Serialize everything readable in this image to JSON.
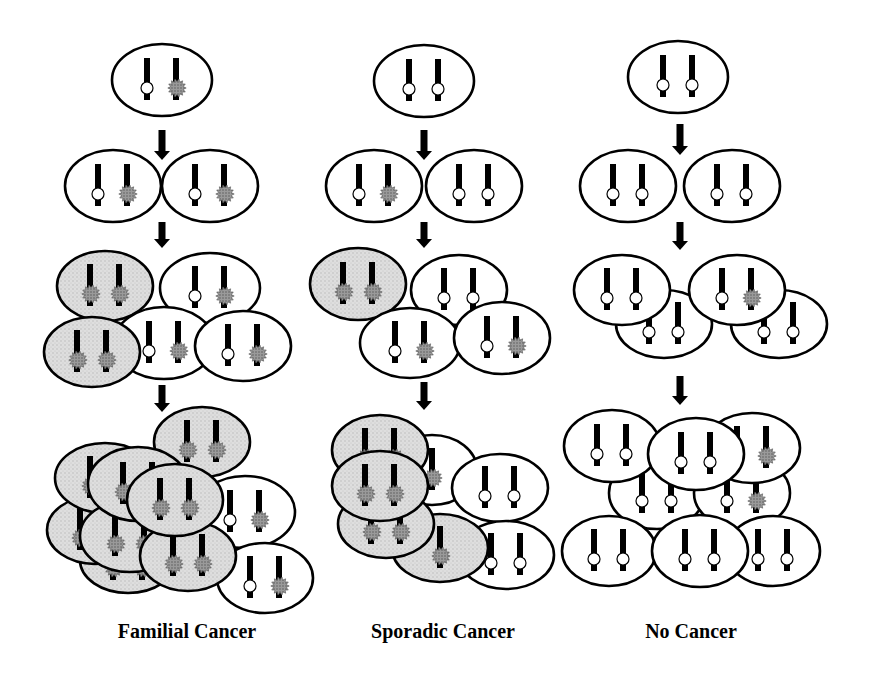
{
  "colors": {
    "outline": "#000000",
    "cell_normal": "#ffffff",
    "cell_tumor": "#d9d9d9",
    "mutant_allele": "#8a8a8a",
    "wildtype_allele": "#ffffff",
    "chromosome": "#000000"
  },
  "legend_semantics": {
    "open-circle": "wild-type allele",
    "spiky-gray-blob": "mutant allele",
    "gray-cell": "tumor cell (both alleles mutated)"
  },
  "columns": [
    {
      "id": "familial",
      "label": "Familial Cancer",
      "label_x": 187,
      "arrows": [
        [
          162,
          130,
          160
        ],
        [
          162,
          222,
          248
        ],
        [
          162,
          385,
          412
        ]
      ],
      "cells": [
        {
          "cx": 162,
          "cy": 80,
          "rx": 50,
          "ry": 36,
          "tumor": false,
          "alleles": [
            "wt",
            "mut"
          ]
        },
        {
          "cx": 113,
          "cy": 186,
          "rx": 48,
          "ry": 36,
          "tumor": false,
          "alleles": [
            "wt",
            "mut"
          ]
        },
        {
          "cx": 210,
          "cy": 186,
          "rx": 48,
          "ry": 36,
          "tumor": false,
          "alleles": [
            "wt",
            "mut"
          ]
        },
        {
          "cx": 210,
          "cy": 288,
          "rx": 50,
          "ry": 35,
          "tumor": false,
          "alleles": [
            "wt",
            "mut"
          ]
        },
        {
          "cx": 105,
          "cy": 286,
          "rx": 48,
          "ry": 35,
          "tumor": true,
          "alleles": [
            "mut",
            "mut"
          ]
        },
        {
          "cx": 164,
          "cy": 343,
          "rx": 50,
          "ry": 36,
          "tumor": false,
          "alleles": [
            "wt",
            "mut"
          ]
        },
        {
          "cx": 243,
          "cy": 346,
          "rx": 48,
          "ry": 35,
          "tumor": false,
          "alleles": [
            "wt",
            "mut"
          ]
        },
        {
          "cx": 92,
          "cy": 352,
          "rx": 48,
          "ry": 35,
          "tumor": true,
          "alleles": [
            "mut",
            "mut"
          ]
        },
        {
          "cx": 128,
          "cy": 560,
          "rx": 48,
          "ry": 33,
          "tumor": true,
          "alleles": [
            "mut",
            "mut"
          ]
        },
        {
          "cx": 245,
          "cy": 512,
          "rx": 50,
          "ry": 36,
          "tumor": false,
          "alleles": [
            "wt",
            "mut"
          ]
        },
        {
          "cx": 265,
          "cy": 578,
          "rx": 48,
          "ry": 35,
          "tumor": false,
          "alleles": [
            "wt",
            "mut"
          ]
        },
        {
          "cx": 95,
          "cy": 530,
          "rx": 48,
          "ry": 34,
          "tumor": true,
          "alleles": [
            "mut",
            "mut"
          ]
        },
        {
          "cx": 105,
          "cy": 478,
          "rx": 50,
          "ry": 35,
          "tumor": true,
          "alleles": [
            "mut",
            "mut"
          ]
        },
        {
          "cx": 202,
          "cy": 442,
          "rx": 48,
          "ry": 35,
          "tumor": true,
          "alleles": [
            "mut",
            "mut"
          ]
        },
        {
          "cx": 130,
          "cy": 536,
          "rx": 50,
          "ry": 36,
          "tumor": true,
          "alleles": [
            "mut",
            "mut"
          ]
        },
        {
          "cx": 138,
          "cy": 484,
          "rx": 50,
          "ry": 37,
          "tumor": true,
          "alleles": [
            "mut",
            "mut"
          ]
        },
        {
          "cx": 188,
          "cy": 556,
          "rx": 48,
          "ry": 35,
          "tumor": true,
          "alleles": [
            "mut",
            "mut"
          ]
        },
        {
          "cx": 175,
          "cy": 500,
          "rx": 48,
          "ry": 36,
          "tumor": true,
          "alleles": [
            "mut",
            "mut"
          ]
        }
      ]
    },
    {
      "id": "sporadic",
      "label": "Sporadic Cancer",
      "label_x": 443,
      "arrows": [
        [
          424,
          130,
          160
        ],
        [
          424,
          222,
          248
        ],
        [
          424,
          382,
          410
        ]
      ],
      "cells": [
        {
          "cx": 424,
          "cy": 81,
          "rx": 50,
          "ry": 36,
          "tumor": false,
          "alleles": [
            "wt",
            "wt"
          ]
        },
        {
          "cx": 374,
          "cy": 186,
          "rx": 48,
          "ry": 36,
          "tumor": false,
          "alleles": [
            "wt",
            "mut"
          ]
        },
        {
          "cx": 474,
          "cy": 186,
          "rx": 48,
          "ry": 36,
          "tumor": false,
          "alleles": [
            "wt",
            "wt"
          ]
        },
        {
          "cx": 459,
          "cy": 290,
          "rx": 48,
          "ry": 35,
          "tumor": false,
          "alleles": [
            "wt",
            "wt"
          ]
        },
        {
          "cx": 358,
          "cy": 284,
          "rx": 48,
          "ry": 36,
          "tumor": true,
          "alleles": [
            "mut",
            "mut"
          ]
        },
        {
          "cx": 410,
          "cy": 343,
          "rx": 50,
          "ry": 35,
          "tumor": false,
          "alleles": [
            "wt",
            "mut"
          ]
        },
        {
          "cx": 502,
          "cy": 338,
          "rx": 48,
          "ry": 36,
          "tumor": false,
          "alleles": [
            "wt",
            "mut"
          ]
        },
        {
          "cx": 432,
          "cy": 470,
          "rx": 45,
          "ry": 35,
          "tumor": false,
          "alleles": [
            "mut"
          ]
        },
        {
          "cx": 500,
          "cy": 488,
          "rx": 48,
          "ry": 34,
          "tumor": false,
          "alleles": [
            "wt",
            "wt"
          ]
        },
        {
          "cx": 506,
          "cy": 555,
          "rx": 48,
          "ry": 34,
          "tumor": false,
          "alleles": [
            "wt",
            "wt"
          ]
        },
        {
          "cx": 440,
          "cy": 548,
          "rx": 48,
          "ry": 34,
          "tumor": true,
          "alleles": [
            "mut"
          ]
        },
        {
          "cx": 386,
          "cy": 524,
          "rx": 48,
          "ry": 34,
          "tumor": true,
          "alleles": [
            "mut",
            "mut"
          ]
        },
        {
          "cx": 380,
          "cy": 450,
          "rx": 48,
          "ry": 35,
          "tumor": true,
          "alleles": [
            "mut",
            "mut"
          ]
        },
        {
          "cx": 380,
          "cy": 486,
          "rx": 48,
          "ry": 35,
          "tumor": true,
          "alleles": [
            "mut",
            "mut"
          ]
        }
      ]
    },
    {
      "id": "none",
      "label": "No Cancer",
      "label_x": 691,
      "arrows": [
        [
          680,
          124,
          155
        ],
        [
          680,
          222,
          250
        ],
        [
          680,
          376,
          405
        ]
      ],
      "cells": [
        {
          "cx": 678,
          "cy": 77,
          "rx": 50,
          "ry": 36,
          "tumor": false,
          "alleles": [
            "wt",
            "wt"
          ]
        },
        {
          "cx": 628,
          "cy": 186,
          "rx": 48,
          "ry": 36,
          "tumor": false,
          "alleles": [
            "wt",
            "wt"
          ]
        },
        {
          "cx": 732,
          "cy": 186,
          "rx": 48,
          "ry": 36,
          "tumor": false,
          "alleles": [
            "wt",
            "wt"
          ]
        },
        {
          "cx": 664,
          "cy": 324,
          "rx": 48,
          "ry": 34,
          "tumor": false,
          "alleles": [
            "wt",
            "wt"
          ]
        },
        {
          "cx": 779,
          "cy": 324,
          "rx": 48,
          "ry": 34,
          "tumor": false,
          "alleles": [
            "wt",
            "wt"
          ]
        },
        {
          "cx": 622,
          "cy": 290,
          "rx": 48,
          "ry": 35,
          "tumor": false,
          "alleles": [
            "wt",
            "wt"
          ]
        },
        {
          "cx": 737,
          "cy": 290,
          "rx": 48,
          "ry": 35,
          "tumor": false,
          "alleles": [
            "wt",
            "mut"
          ]
        },
        {
          "cx": 657,
          "cy": 493,
          "rx": 48,
          "ry": 36,
          "tumor": false,
          "alleles": [
            "wt",
            "wt"
          ]
        },
        {
          "cx": 742,
          "cy": 493,
          "rx": 48,
          "ry": 36,
          "tumor": false,
          "alleles": [
            "wt",
            "mut"
          ]
        },
        {
          "cx": 752,
          "cy": 448,
          "rx": 48,
          "ry": 35,
          "tumor": false,
          "alleles": [
            "wt",
            "mut"
          ]
        },
        {
          "cx": 609,
          "cy": 551,
          "rx": 47,
          "ry": 35,
          "tumor": false,
          "alleles": [
            "wt",
            "wt"
          ]
        },
        {
          "cx": 773,
          "cy": 551,
          "rx": 47,
          "ry": 35,
          "tumor": false,
          "alleles": [
            "wt",
            "wt"
          ]
        },
        {
          "cx": 612,
          "cy": 446,
          "rx": 48,
          "ry": 36,
          "tumor": false,
          "alleles": [
            "wt",
            "wt"
          ]
        },
        {
          "cx": 696,
          "cy": 454,
          "rx": 48,
          "ry": 36,
          "tumor": false,
          "alleles": [
            "wt",
            "wt"
          ]
        },
        {
          "cx": 700,
          "cy": 551,
          "rx": 48,
          "ry": 36,
          "tumor": false,
          "alleles": [
            "wt",
            "wt"
          ]
        }
      ]
    }
  ]
}
